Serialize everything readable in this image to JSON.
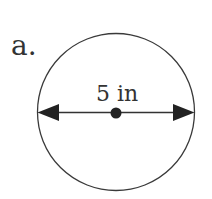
{
  "problem": {
    "label": "a.",
    "shape": "circle",
    "measurement": "5 in",
    "measurement_type": "diameter"
  },
  "colors": {
    "stroke": "#333333",
    "background": "#ffffff"
  }
}
